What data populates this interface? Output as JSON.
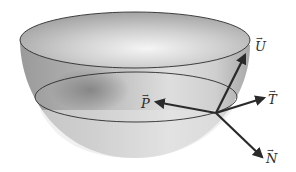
{
  "figure": {
    "vectors": [
      {
        "id": "U",
        "label": "U",
        "origin": [
          216,
          113
        ],
        "tip": [
          245,
          55
        ],
        "label_pos": [
          253,
          37
        ]
      },
      {
        "id": "T",
        "label": "T",
        "origin": [
          216,
          113
        ],
        "tip": [
          264,
          98
        ],
        "label_pos": [
          267,
          91
        ]
      },
      {
        "id": "P",
        "label": "P",
        "origin": [
          216,
          113
        ],
        "tip": [
          156,
          102
        ],
        "label_pos": [
          140,
          96
        ]
      },
      {
        "id": "N",
        "label": "N",
        "origin": [
          216,
          113
        ],
        "tip": [
          262,
          157
        ],
        "label_pos": [
          266,
          150
        ]
      }
    ],
    "arrow_mark": "→",
    "colors": {
      "outline": "#2b2b2b",
      "vector": "#2a2a2a",
      "bowl_light": "#e8e8e8",
      "bowl_dark": "#8a8a8a",
      "background": "#ffffff"
    }
  }
}
